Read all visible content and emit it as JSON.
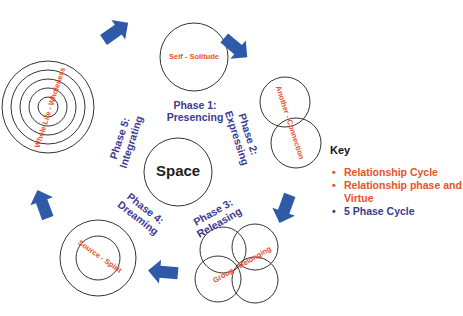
{
  "diagram": {
    "center": {
      "label": "Space"
    },
    "relationships": [
      {
        "id": "self",
        "label": "Self - Solitude",
        "shape": "single circle"
      },
      {
        "id": "another",
        "label": "Another - Connection",
        "shape": "two overlapping circles"
      },
      {
        "id": "group",
        "label": "Group - Belonging",
        "shape": "four overlapping circles"
      },
      {
        "id": "source",
        "label": "Source - Spirit",
        "shape": "two concentric circles"
      },
      {
        "id": "wholelife",
        "label": "Whole Life - Wholeness",
        "shape": "five concentric circles"
      }
    ],
    "phases": [
      {
        "line1": "Phase 1:",
        "line2": "Presencing"
      },
      {
        "line1": "Phase 2:",
        "line2": "Expressing"
      },
      {
        "line1": "Phase 3:",
        "line2": "Releasing"
      },
      {
        "line1": "Phase 4:",
        "line2": "Dreaming"
      },
      {
        "line1": "Phase 5:",
        "line2": "Integrating"
      }
    ],
    "arrows": [
      "self-to-another",
      "another-to-group",
      "group-to-source",
      "source-to-wholelife",
      "wholelife-to-self"
    ]
  },
  "key": {
    "title": "Key",
    "items": [
      {
        "bullet": "•",
        "label": "Relationship Cycle",
        "color": "#e8522a"
      },
      {
        "bullet": "•",
        "label": "Relationship phase and",
        "label2": "Virtue",
        "color": "#e8522a"
      },
      {
        "bullet": "•",
        "label": "5 Phase Cycle",
        "color": "#3b3a8f"
      }
    ]
  },
  "colors": {
    "relationship": "#e8522a",
    "phase": "#3b3a8f",
    "arrow": "#2f5aa8",
    "circle_stroke": "#333333"
  }
}
